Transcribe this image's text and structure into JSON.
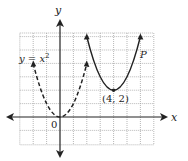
{
  "figure": {
    "axes": {
      "x_label": "x",
      "y_label": "y",
      "origin_label": "0"
    },
    "grid": {
      "x_min": -3,
      "x_max": 7,
      "y_min": -2,
      "y_max": 6.3,
      "step": 1
    },
    "curves": [
      {
        "name": "y = x²",
        "label_text": "y = x",
        "label_sup": "2",
        "style": "dashed",
        "equation": "y=x^2",
        "x_range": [
          -2,
          2
        ]
      },
      {
        "name": "P",
        "label_text": "P",
        "style": "solid",
        "equation": "y=(x-4)^2+2",
        "x_range": [
          2,
          6
        ]
      }
    ],
    "points": [
      {
        "label": "(4, 2)",
        "x": 4,
        "y": 2
      }
    ],
    "colors": {
      "curve": "#222222",
      "grid": "#9a9a9a",
      "axis": "#222222"
    }
  }
}
